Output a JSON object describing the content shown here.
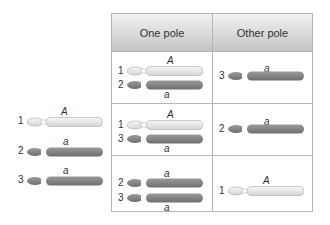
{
  "colors": {
    "light_chromosome": "#ececec",
    "dark_chromosome": "#8a8a8a",
    "border": "#b5b5b5",
    "header_top": "#f2f2f2",
    "header_bottom": "#c4c4c4"
  },
  "left_panel": {
    "chromosomes": [
      {
        "number": "1",
        "allele": "A",
        "shade": "light"
      },
      {
        "number": "2",
        "allele": "a",
        "shade": "dark"
      },
      {
        "number": "3",
        "allele": "a",
        "shade": "dark"
      }
    ]
  },
  "table": {
    "headers": [
      "One pole",
      "Other pole"
    ],
    "rows": [
      {
        "one_pole": [
          {
            "number": "1",
            "allele": "A",
            "shade": "light"
          },
          {
            "number": "2",
            "allele": "a",
            "shade": "dark"
          }
        ],
        "other_pole": [
          {
            "number": "3",
            "allele": "a",
            "shade": "dark"
          }
        ]
      },
      {
        "one_pole": [
          {
            "number": "1",
            "allele": "A",
            "shade": "light"
          },
          {
            "number": "3",
            "allele": "a",
            "shade": "dark"
          }
        ],
        "other_pole": [
          {
            "number": "2",
            "allele": "a",
            "shade": "dark"
          }
        ]
      },
      {
        "one_pole": [
          {
            "number": "2",
            "allele": "a",
            "shade": "dark"
          },
          {
            "number": "3",
            "allele": "a",
            "shade": "dark"
          }
        ],
        "other_pole": [
          {
            "number": "1",
            "allele": "A",
            "shade": "light"
          }
        ]
      }
    ]
  }
}
